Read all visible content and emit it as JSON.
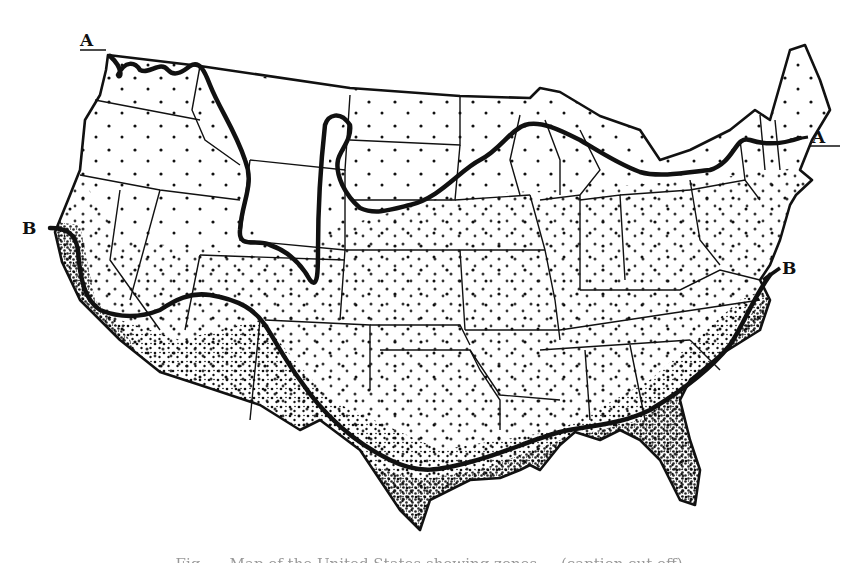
{
  "figure": {
    "type": "stipple map",
    "ink_color": "#111111",
    "background_color": "#ffffff"
  },
  "lines": [
    {
      "id": "A",
      "label": "A",
      "start_label": "A",
      "end_label": "A",
      "description": "Northern boundary line from Washington coast across northern Rockies, Dakotas, Great Lakes to New England"
    },
    {
      "id": "B",
      "label": "B",
      "start_label": "B",
      "end_label": "B",
      "description": "Southern boundary line from central California coast across Southwest, Texas, Gulf Coast to Virginia coast"
    }
  ],
  "labels": {
    "line_a_west": "A",
    "line_a_east": "A",
    "line_b_west": "B",
    "line_b_east": "B"
  },
  "stipple_zones": [
    {
      "zone": "north",
      "density": "sparse"
    },
    {
      "zone": "central",
      "density": "moderate"
    },
    {
      "zone": "south_gulf_coast",
      "density": "dense"
    }
  ],
  "caption": {
    "text": "Fig. — Map of the United States showing zones ... (caption cut off)",
    "visibility": "partially cut off at bottom edge"
  }
}
